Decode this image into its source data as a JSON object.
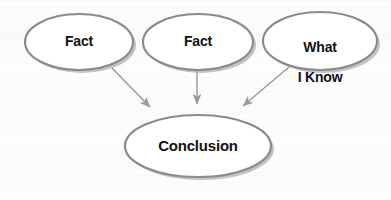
{
  "diagram": {
    "background_color": "#fdfdfd",
    "node_fill": "#ffffff",
    "node_stroke": "#8a8a8a",
    "shadow_color": "#b4b4b4",
    "arrow_color": "#9a9a9a",
    "text_color": "#111111",
    "nodes": [
      {
        "id": "fact-1",
        "label": "Fact",
        "shape": "ellipse",
        "cx": 79,
        "cy": 42,
        "rx": 54,
        "ry": 28
      },
      {
        "id": "fact-2",
        "label": "Fact",
        "shape": "ellipse",
        "cx": 198,
        "cy": 42,
        "rx": 55,
        "ry": 28
      },
      {
        "id": "what-i-know",
        "label": "What\nI Know",
        "label_line_1": "What",
        "label_line_2": "I Know",
        "shape": "ellipse",
        "cx": 320,
        "cy": 41,
        "rx": 57,
        "ry": 29
      },
      {
        "id": "conclusion",
        "label": "Conclusion",
        "shape": "ellipse",
        "cx": 198,
        "cy": 146,
        "rx": 73,
        "ry": 31
      }
    ],
    "arrows": [
      {
        "id": "arrow-fact-1-to-conclusion",
        "from": "fact-1",
        "to": "conclusion",
        "x1": 112,
        "y1": 68,
        "x2": 153,
        "y2": 110
      },
      {
        "id": "arrow-fact-2-to-conclusion",
        "from": "fact-2",
        "to": "conclusion",
        "x1": 197,
        "y1": 71,
        "x2": 197,
        "y2": 110
      },
      {
        "id": "arrow-what-i-know-to-conclusion",
        "from": "what-i-know",
        "to": "conclusion",
        "x1": 289,
        "y1": 67,
        "x2": 240,
        "y2": 110
      }
    ]
  }
}
